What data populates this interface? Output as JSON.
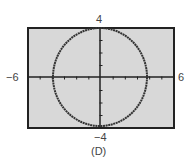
{
  "chart_data": {
    "type": "line",
    "title": "",
    "caption": "(D)",
    "window": {
      "xmin": -6,
      "xmax": 6,
      "ymin": -4,
      "ymax": 4
    },
    "xlabel": "",
    "ylabel": "",
    "tick_labels": {
      "left": "−6",
      "right": "6",
      "top": "4",
      "bottom": "−4"
    },
    "xlim": [
      -6,
      6
    ],
    "ylim": [
      -4,
      4
    ],
    "x_tick_step": 1,
    "y_tick_step": 1,
    "grid": false,
    "series": [
      {
        "name": "circle",
        "shape": "circle",
        "center": [
          0,
          0
        ],
        "radius": 4
      }
    ]
  },
  "colors": {
    "screen": "#d8d8d8",
    "frame": "#222222",
    "curve": "#333333",
    "axes": "#222222"
  }
}
